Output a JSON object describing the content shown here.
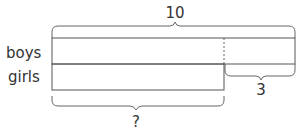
{
  "diagram": {
    "type": "tape-diagram",
    "total_label": "10",
    "difference_label": "3",
    "unknown_label": "?",
    "rows": [
      {
        "label": "boys"
      },
      {
        "label": "girls"
      }
    ],
    "colors": {
      "line": "#555555",
      "text": "#333333"
    }
  }
}
